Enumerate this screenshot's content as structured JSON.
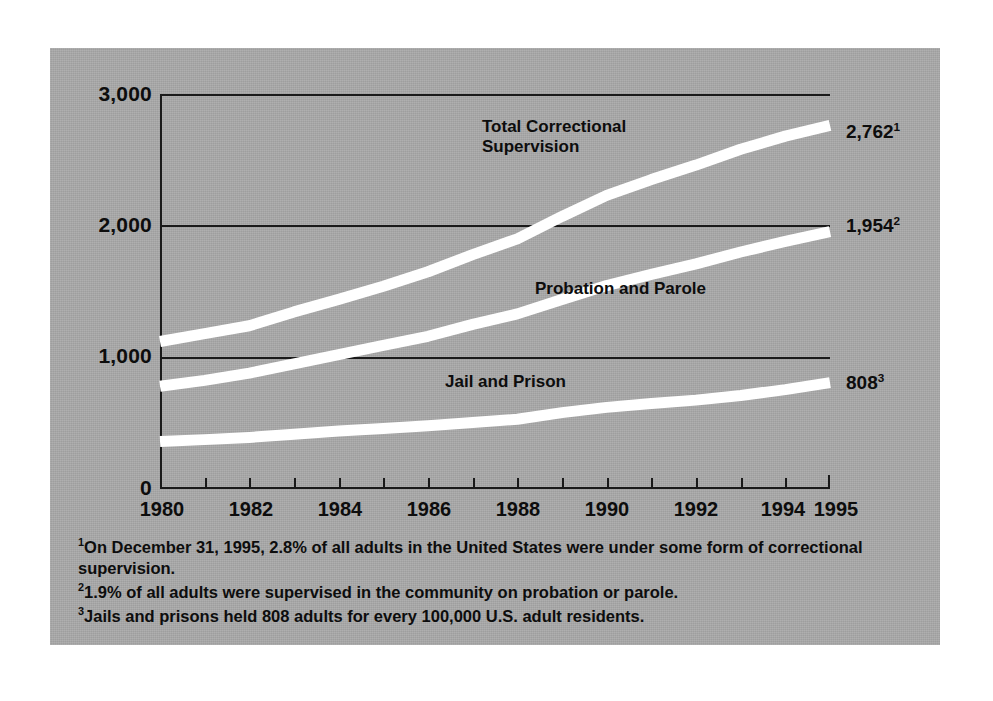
{
  "chart_data": {
    "type": "line",
    "title": "",
    "subtitle": "",
    "xlabel": "",
    "ylabel": "",
    "xlim": [
      1980,
      1995
    ],
    "ylim": [
      0,
      3000
    ],
    "grid": true,
    "legend_position": "inline-labels",
    "yticks": [
      "0",
      "1,000",
      "2,000",
      "3,000"
    ],
    "ytick_values": [
      0,
      1000,
      2000,
      3000
    ],
    "xticks": [
      "1980",
      "1982",
      "1984",
      "1986",
      "1988",
      "1990",
      "1992",
      "1994",
      "1995"
    ],
    "xtick_values": [
      1980,
      1982,
      1984,
      1986,
      1988,
      1990,
      1992,
      1994,
      1995
    ],
    "x": [
      1980,
      1981,
      1982,
      1983,
      1984,
      1985,
      1986,
      1987,
      1988,
      1989,
      1990,
      1991,
      1992,
      1993,
      1994,
      1995
    ],
    "series": [
      {
        "name": "Total Correctional Supervision",
        "label_text": "Total Correctional\nSupervision",
        "end_value": 2762,
        "end_label": "2,762",
        "end_label_footnote": "1",
        "color": "#ffffff",
        "values": [
          1120,
          1180,
          1240,
          1345,
          1440,
          1540,
          1650,
          1780,
          1900,
          2070,
          2230,
          2350,
          2460,
          2580,
          2680,
          2762
        ]
      },
      {
        "name": "Probation and Parole",
        "label_text": "Probation and Parole",
        "end_value": 1954,
        "end_label": "1,954",
        "end_label_footnote": "2",
        "color": "#ffffff",
        "values": [
          780,
          825,
          880,
          950,
          1020,
          1090,
          1160,
          1250,
          1330,
          1440,
          1545,
          1630,
          1710,
          1800,
          1880,
          1954
        ]
      },
      {
        "name": "Jail and Prison",
        "label_text": "Jail and Prison",
        "end_value": 808,
        "end_label": "808",
        "end_label_footnote": "3",
        "color": "#ffffff",
        "values": [
          360,
          375,
          392,
          415,
          440,
          460,
          480,
          505,
          530,
          580,
          620,
          650,
          675,
          710,
          755,
          808
        ]
      }
    ],
    "footnotes": [
      {
        "marker": "1",
        "text": "On December 31, 1995, 2.8% of all adults in the United States were under some form of correctional supervision."
      },
      {
        "marker": "2",
        "text": "1.9% of all adults were supervised in the community on probation or parole."
      },
      {
        "marker": "3",
        "text": "Jails and prisons held 808 adults for every 100,000 U.S. adult residents."
      }
    ],
    "colors": {
      "panel_background": "#a9a9a9",
      "line": "#ffffff",
      "axis": "#0d0d0d",
      "text": "#0d0d0d",
      "page_background": "#ffffff"
    }
  }
}
